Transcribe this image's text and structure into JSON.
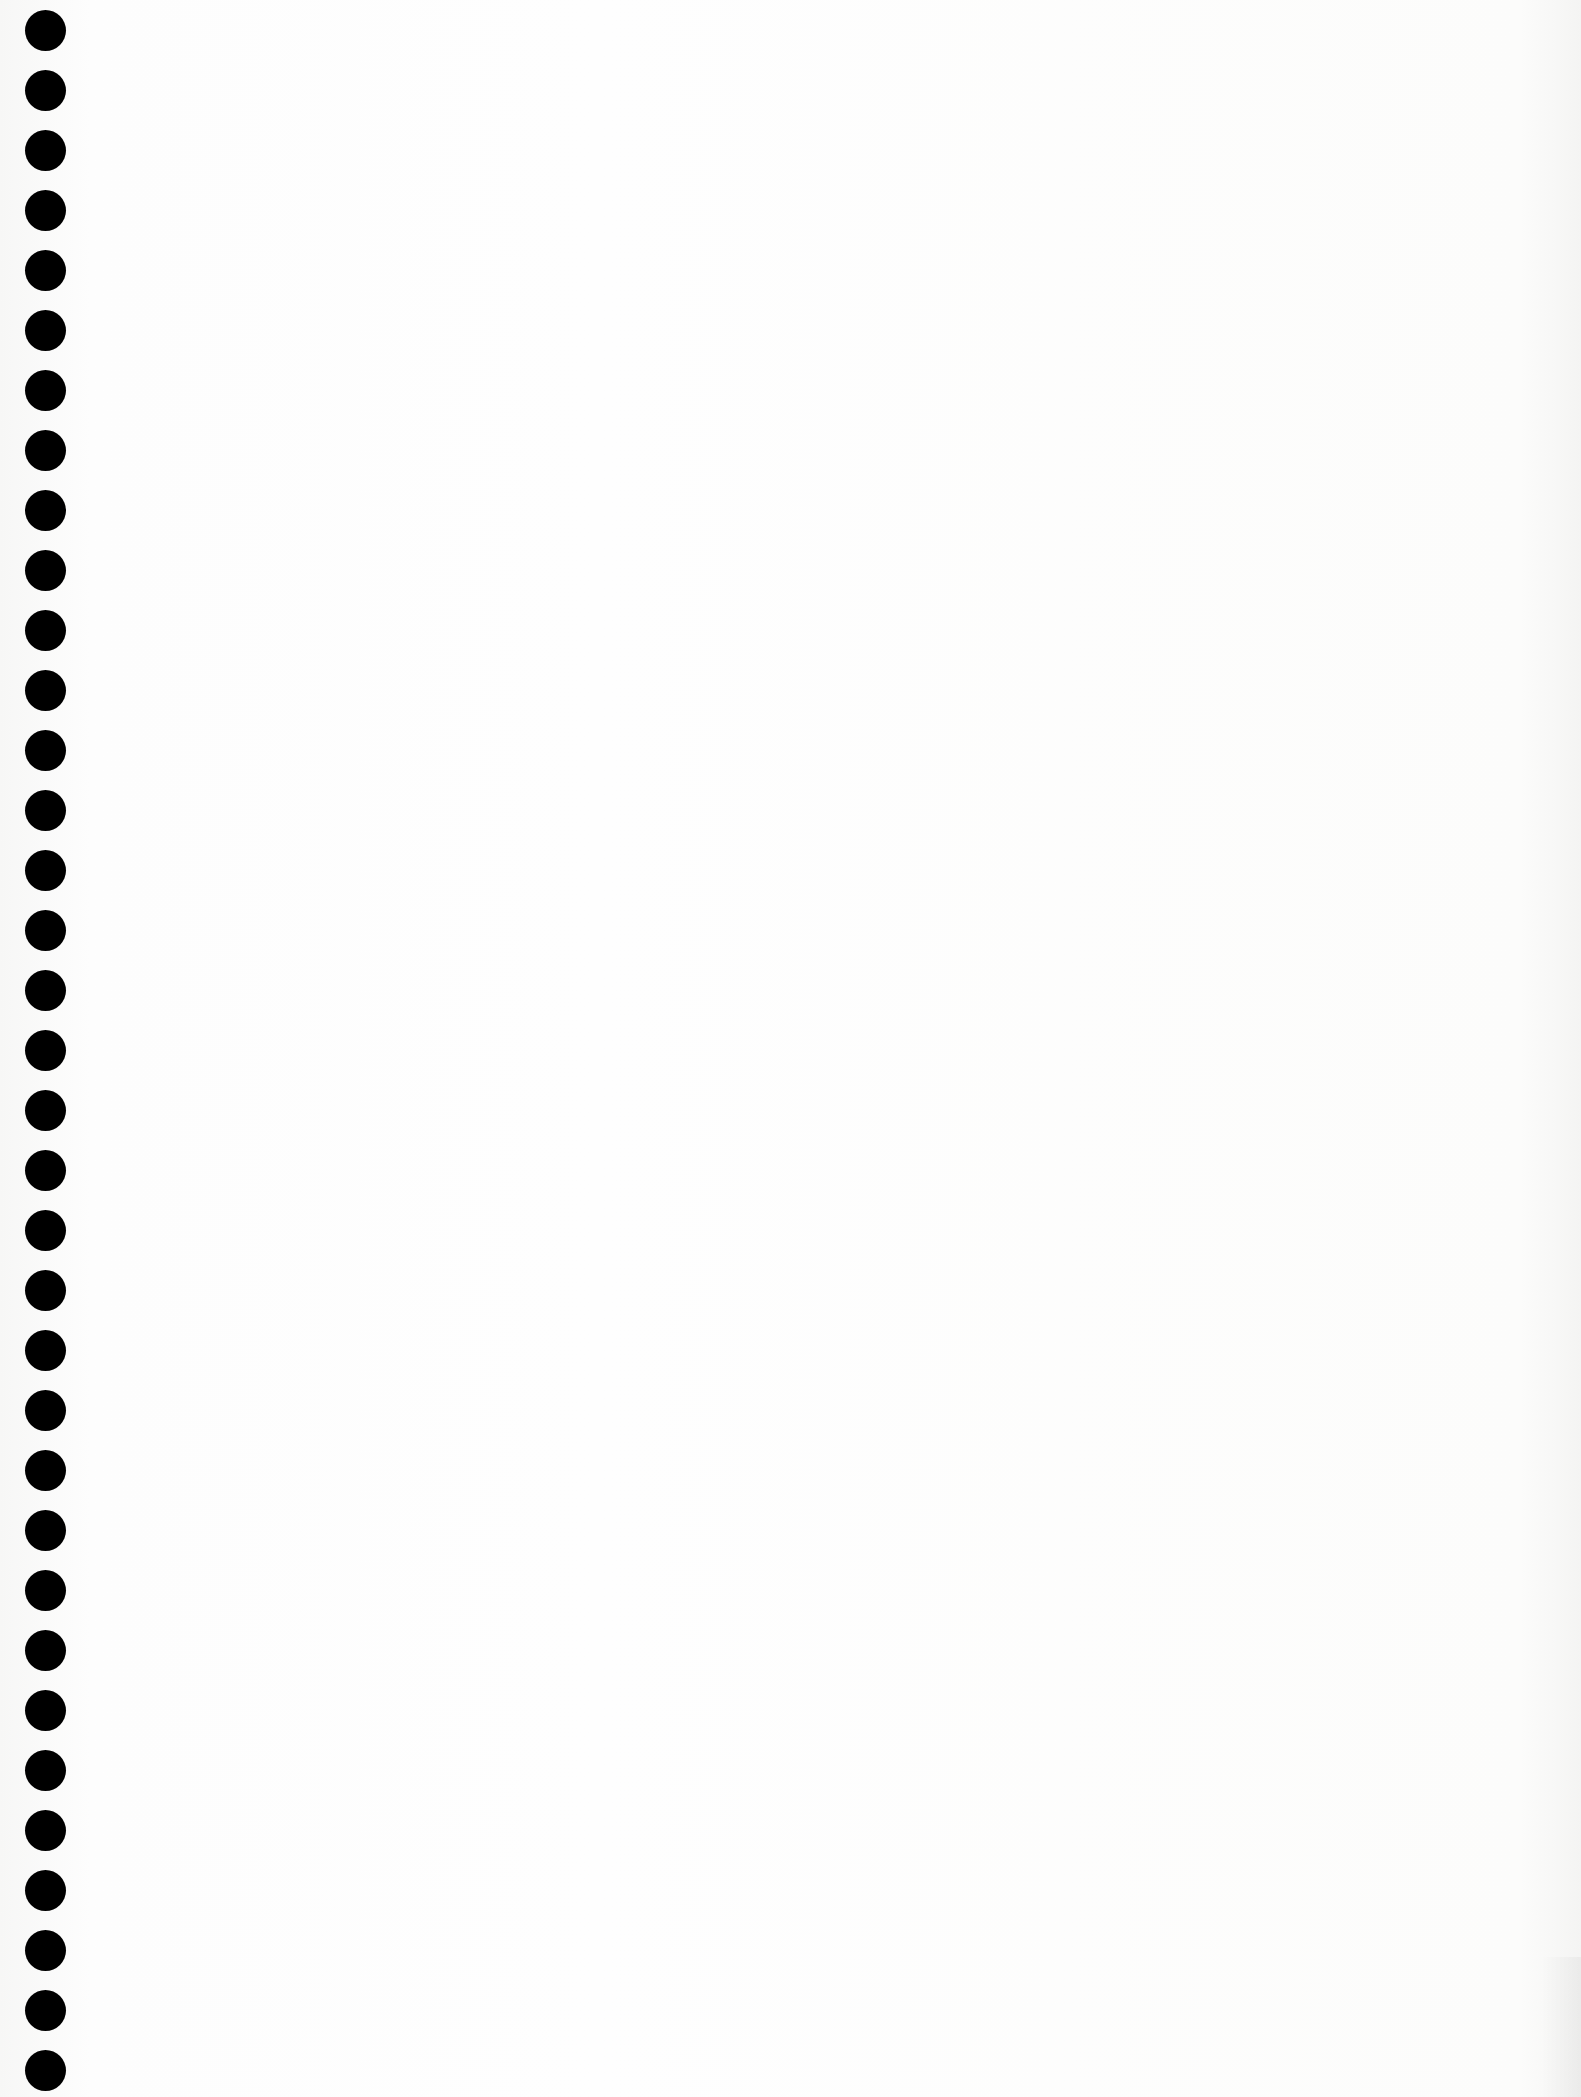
{
  "page": {
    "type": "blank-notebook-page",
    "background_color": "#fdfdfc",
    "binding": {
      "hole_count": 35,
      "hole_color": "#000000",
      "hole_diameter_px": 41,
      "hole_pitch_px": 60,
      "first_hole_center_y": 30,
      "hole_center_x": 45
    }
  }
}
